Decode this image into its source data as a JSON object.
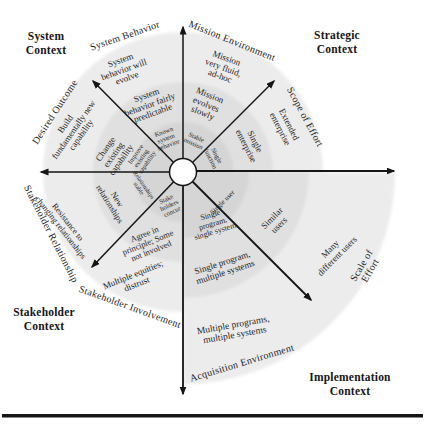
{
  "figure": {
    "contexts": [
      {
        "id": "system-context",
        "label": "System\nContext"
      },
      {
        "id": "strategic-context",
        "label": "Strategic\nContext"
      },
      {
        "id": "stakeholder-context",
        "label": "Stakeholder\nContext"
      },
      {
        "id": "implementation-context",
        "label": "Implementation\nContext"
      }
    ],
    "axes": [
      {
        "id": "system-behavior",
        "label": "System Behavior"
      },
      {
        "id": "mission-environment",
        "label": "Mission Environment"
      },
      {
        "id": "scope-of-effort",
        "label": "Scope of Effort"
      },
      {
        "id": "scale-of-effort",
        "label": "Scale of Effort"
      },
      {
        "id": "acquisition-environment",
        "label": "Acquisition Environment"
      },
      {
        "id": "stakeholder-involvement",
        "label": "Stakeholder Involvement"
      },
      {
        "id": "stakeholder-relationship",
        "label": "Stakeholder Relationship"
      },
      {
        "id": "desired-outcome",
        "label": "Desired Outcome"
      }
    ],
    "ring_labels": [
      {
        "id": "system-behavior-outer",
        "text": "System\nbehavior will\nevolve",
        "x": 124,
        "y": 70,
        "rot": -20,
        "fs": 9
      },
      {
        "id": "system-behavior-mid",
        "text": "System\nbehavior fairly\npredictable",
        "x": 150,
        "y": 105,
        "rot": -20,
        "fs": 9
      },
      {
        "id": "system-behavior-inner",
        "text": "Known\nsystem\nbehavior",
        "x": 166,
        "y": 138,
        "rot": -20,
        "fs": 6.5
      },
      {
        "id": "mission-environment-outer",
        "text": "Mission\nvery fluid,\nad-hoc",
        "x": 223,
        "y": 68,
        "rot": 20,
        "fs": 9
      },
      {
        "id": "mission-environment-mid",
        "text": "Mission\nevolves\nslowly",
        "x": 206,
        "y": 105,
        "rot": 22,
        "fs": 9
      },
      {
        "id": "mission-environment-inner",
        "text": "Stable\nmission",
        "x": 195,
        "y": 140,
        "rot": 25,
        "fs": 6.5
      },
      {
        "id": "scope-of-effort-outer",
        "text": "Extended\nenterprise",
        "x": 284,
        "y": 127,
        "rot": 63,
        "fs": 9
      },
      {
        "id": "scope-of-effort-mid",
        "text": "Single\nenterprise",
        "x": 250,
        "y": 144,
        "rot": 63,
        "fs": 9
      },
      {
        "id": "scope-of-effort-inner",
        "text": "Single\nfunction",
        "x": 214,
        "y": 157,
        "rot": 63,
        "fs": 6.5
      },
      {
        "id": "scale-of-effort-outer",
        "text": "Many\ndifferent users",
        "x": 334,
        "y": 253,
        "rot": -45,
        "fs": 9
      },
      {
        "id": "scale-of-effort-mid",
        "text": "Similar\nusers",
        "x": 276,
        "y": 222,
        "rot": -45,
        "fs": 9
      },
      {
        "id": "scale-of-effort-inner",
        "text": "Single user",
        "x": 223,
        "y": 203,
        "rot": -45,
        "fs": 7
      },
      {
        "id": "acquisition-environment-outer",
        "text": "Multiple programs,\nmultiple systems",
        "x": 234,
        "y": 330,
        "rot": -10,
        "fs": 9.5
      },
      {
        "id": "acquisition-environment-mid",
        "text": "Single program,\nmultiple systems",
        "x": 224,
        "y": 268,
        "rot": -18,
        "fs": 9
      },
      {
        "id": "acquisition-environment-inner",
        "text": "Single\nprogram,\nsingle system",
        "x": 213,
        "y": 224,
        "rot": -17,
        "fs": 8
      },
      {
        "id": "stakeholder-involvement-outer",
        "text": "Multiple equities;\ndistrust",
        "x": 135,
        "y": 280,
        "rot": -22,
        "fs": 9
      },
      {
        "id": "stakeholder-involvement-mid",
        "text": "Agree in\nprinciple; Some\nnot involved",
        "x": 148,
        "y": 243,
        "rot": -22,
        "fs": 8.5
      },
      {
        "id": "stakeholder-involvement-inner",
        "text": "Stake\nholders\nconcur",
        "x": 169,
        "y": 205,
        "rot": -25,
        "fs": 6.5
      },
      {
        "id": "stakeholder-relationship-outer",
        "text": "Resistance to\nchanging relationships",
        "x": 64,
        "y": 225,
        "rot": 52,
        "fs": 8.5
      },
      {
        "id": "stakeholder-relationship-mid",
        "text": "New\nrelationships",
        "x": 113,
        "y": 202,
        "rot": 58,
        "fs": 8.5
      },
      {
        "id": "stakeholder-relationship-inner",
        "text": "Relationships\nstable",
        "x": 141,
        "y": 187,
        "rot": 55,
        "fs": 6
      },
      {
        "id": "desired-outcome-outer",
        "text": "Build\nfundamentally new\ncapability",
        "x": 74,
        "y": 130,
        "rot": -55,
        "fs": 9
      },
      {
        "id": "desired-outcome-mid",
        "text": "Change\nexisting\ncapability",
        "x": 114,
        "y": 155,
        "rot": -55,
        "fs": 9
      },
      {
        "id": "desired-outcome-inner",
        "text": "Improve\nexisting\ncapability",
        "x": 141,
        "y": 158,
        "rot": -55,
        "fs": 6.5
      }
    ]
  },
  "colors": {
    "band_outer": "#ececec",
    "band_mid": "#e0e0e0",
    "band_inner": "#d5d5d5",
    "ink": "#151515",
    "background": "#ffffff"
  }
}
